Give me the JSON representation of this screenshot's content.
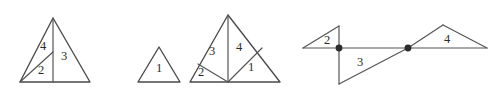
{
  "figure": {
    "title": "",
    "background_color": "#ffffff",
    "stroke_color": "#4a4a4a",
    "label_color": "#2b2b2b",
    "vertex_dot_color": "#2b2b2b",
    "width": 502,
    "height": 99,
    "shapes": [
      {
        "id": "shape-1",
        "name": "subdivided-triangle-left",
        "description": "Triangle with vertical cevian from apex to base and a segment from bottom-left vertex to the midpoint of the cevian",
        "outline": "20,82 53,18 90,82",
        "internal_segments": [
          "53,18 53,82",
          "20,82 53,52"
        ],
        "region_labels": [
          {
            "text": "4",
            "x": 43,
            "y": 47
          },
          {
            "text": "3",
            "x": 64,
            "y": 57
          },
          {
            "text": "2",
            "x": 41,
            "y": 71
          }
        ]
      },
      {
        "id": "shape-2",
        "name": "plain-triangle-middle",
        "description": "Small plain triangle with a single region",
        "outline": "138,82 159,47 180,82",
        "internal_segments": [],
        "region_labels": [
          {
            "text": "1",
            "x": 159,
            "y": 69
          }
        ]
      },
      {
        "id": "shape-3",
        "name": "subdivided-triangle-right",
        "description": "Triangle with vertical cevian from apex to base midpoint, a segment from base midpoint to the left edge, and a segment from base midpoint to the right edge",
        "outline": "190,82 228,15 280,82",
        "internal_segments": [
          "228,15 228,82",
          "228,82 198,64",
          "228,82 262,48"
        ],
        "region_labels": [
          {
            "text": "3",
            "x": 212,
            "y": 52
          },
          {
            "text": "4",
            "x": 239,
            "y": 48
          },
          {
            "text": "2",
            "x": 201,
            "y": 73
          },
          {
            "text": "1",
            "x": 251,
            "y": 68
          }
        ]
      },
      {
        "id": "shape-4",
        "name": "zigzag-triangle-chain",
        "description": "Chain of three triangles along a horizontal baseline joined at two marked vertices",
        "outline": "",
        "internal_segments": [
          "303,48 487,48",
          "303,48 339,26",
          "339,26 339,84",
          "339,84 408,48",
          "408,48 443,25",
          "443,25 487,48"
        ],
        "vertex_dots": [
          {
            "x": 339,
            "y": 48,
            "r": 3.4
          },
          {
            "x": 408,
            "y": 48,
            "r": 3.4
          }
        ],
        "region_labels": [
          {
            "text": "2",
            "x": 327,
            "y": 41
          },
          {
            "text": "3",
            "x": 360,
            "y": 63
          },
          {
            "text": "4",
            "x": 447,
            "y": 40
          }
        ]
      }
    ]
  }
}
